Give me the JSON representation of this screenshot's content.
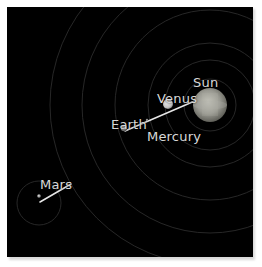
{
  "scene": {
    "title": "Inner Solar System Orbit Diagram",
    "background_color": "#000000",
    "frame_color": "#ffffff",
    "label_color": "#d8d8d8",
    "orbit_line_color": "#2a2a2a",
    "pointer_line_color": "#e8e8e8"
  },
  "bodies": {
    "sun": {
      "label": "Sun",
      "color": "#9a9a92",
      "radius_px": 17,
      "cx": 203,
      "cy": 98
    },
    "venus": {
      "label": "Venus",
      "color": "#cfcfcf",
      "radius_px": 5,
      "cx": 161,
      "cy": 97
    },
    "earth": {
      "label": "Earth",
      "color": "#8f8f8f",
      "radius_px": 3,
      "cx": 117,
      "cy": 121
    },
    "mercury": {
      "label": "Mercury",
      "color": "#8a8a8a",
      "radius_px": 1,
      "cx": 140,
      "cy": 113
    },
    "mars": {
      "label": "Mars",
      "color": "#b8b8b8",
      "radius_px": 2,
      "cx": 32,
      "cy": 188
    }
  },
  "orbits": [
    {
      "name": "mercury-orbit",
      "rx": 26,
      "ry": 26
    },
    {
      "name": "venus-orbit",
      "rx": 45,
      "ry": 45
    },
    {
      "name": "earth-orbit",
      "rx": 62,
      "ry": 62
    },
    {
      "name": "mars-orbit",
      "rx": 95,
      "ry": 95
    },
    {
      "name": "outer-orbit-1",
      "rx": 128,
      "ry": 128
    },
    {
      "name": "outer-orbit-2",
      "rx": 160,
      "ry": 160
    }
  ],
  "pointers": [
    {
      "name": "earth-sun-pointer",
      "x1": 118,
      "x2": 189,
      "y1": 123,
      "y2": 93
    },
    {
      "name": "mars-pointer",
      "x1": 33,
      "x2": 63,
      "y1": 194,
      "y2": 177
    }
  ]
}
